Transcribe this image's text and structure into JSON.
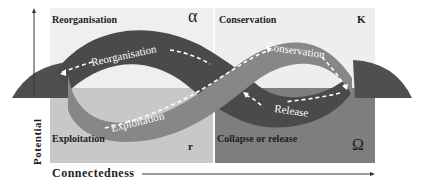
{
  "diagram": {
    "quadrants": [
      {
        "id": "top-left",
        "label": "Reorganisation",
        "symbol": "α",
        "color": "#efefef"
      },
      {
        "id": "top-right",
        "label": "Conservation",
        "symbol": "K",
        "color": "#eeeeee"
      },
      {
        "id": "bottom-left",
        "label": "Exploitation",
        "symbol": "r",
        "color": "#c8c8c8"
      },
      {
        "id": "bottom-right",
        "label": "Collapse or release",
        "symbol": "Ω",
        "color": "#7e7e7e"
      }
    ],
    "loop_labels": {
      "reorganisation": "Reorganisation",
      "conservation": "Conservation",
      "exploitation": "Exploitation",
      "release": "Release"
    },
    "axes": {
      "y_label": "Potential",
      "x_label": "Connectedness"
    },
    "colors": {
      "dark_ribbon": "#4a4a4a",
      "mid_ribbon": "#878787",
      "side_lobes": "#4f4f4f",
      "arrow": "#ffffff",
      "axis": "#333333"
    }
  }
}
